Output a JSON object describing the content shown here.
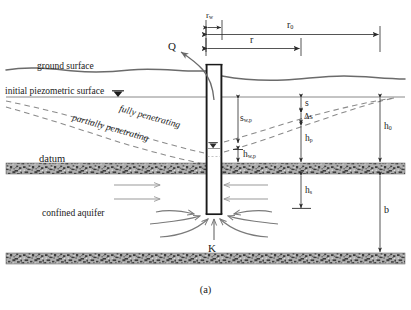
{
  "figure": {
    "caption": "(a)"
  },
  "labels": {
    "ground_surface": "ground surface",
    "initial_piezometric_surface": "initial piezometric surface",
    "datum": "datum",
    "confined_aquifer": "confined aquifer",
    "fully_penetrating": "fully penetrating",
    "partially_penetrating": "partially penetrating",
    "discharge": "Q",
    "hydraulic_conductivity": "K"
  },
  "dimensions": {
    "r_w": {
      "base": "r",
      "sub": "w"
    },
    "r_0": {
      "base": "r",
      "sub": "0"
    },
    "r": {
      "base": "r",
      "sub": ""
    },
    "s_wp": {
      "base": "s",
      "sub": "w,p"
    },
    "h_wp": {
      "base": "h",
      "sub": "w,p"
    },
    "s": {
      "base": "s",
      "sub": ""
    },
    "delta_s": {
      "base": "Δs",
      "sub": ""
    },
    "h_p": {
      "base": "h",
      "sub": "p"
    },
    "h_0": {
      "base": "h",
      "sub": "0"
    },
    "h_s": {
      "base": "h",
      "sub": "s"
    },
    "b": {
      "base": "b",
      "sub": ""
    }
  },
  "symbols": {
    "piezometric_marker": "▼",
    "well_water_level_marker": "▼"
  },
  "colors": {
    "line": "#3a3a3a",
    "ground_line": "#6b6b6b",
    "dashed": "#8a8a8a",
    "arrow_flow": "#9a9a9a",
    "arrow_converge": "#7a7a7a",
    "layer_fill": "#a8a8a8",
    "well_outline": "#1a1a1a",
    "text": "#1a1a1a",
    "background": "#ffffff"
  }
}
